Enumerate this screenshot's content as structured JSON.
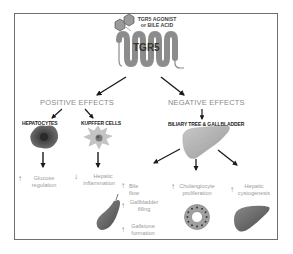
{
  "diagram": {
    "receptor": {
      "ligand_label_line1": "TGR5 AGONIST",
      "ligand_label_line2": "or BILE ACID",
      "receptor_label": "TGR5"
    },
    "positive": {
      "title": "POSITIVE EFFECTS",
      "targets": [
        {
          "label": "HEPATOCYTES",
          "effect_direction": "↑",
          "effect_line1": "Glucose",
          "effect_line2": "regulation"
        },
        {
          "label": "KUPFFER CELLS",
          "effect_direction": "↓",
          "effect_line1": "Hepatic",
          "effect_line2": "inflammation"
        }
      ]
    },
    "negative": {
      "title": "NEGATIVE EFFECTS",
      "target": "BILIARY TREE & GALLBLADDER",
      "effects": [
        {
          "direction": "↑",
          "line1": "Bile flow",
          "line2": ""
        },
        {
          "direction": "↑",
          "line1": "Gallbladder",
          "line2": "filling"
        },
        {
          "direction": "↑",
          "line1": "Gallstone",
          "line2": "formation"
        },
        {
          "direction": "↑",
          "line1": "Cholangiocyte",
          "line2": "proliferation"
        },
        {
          "direction": "↑",
          "line1": "Hepatic",
          "line2": "cystogenesis"
        }
      ]
    },
    "colors": {
      "frame": "#6f6f6f",
      "arrow": "#1a1a1a",
      "section_title": "#8a8a8a",
      "effect_text": "#9a9a9a",
      "receptor": "#8c8c8c",
      "hepatocyte": "#4a4a4a",
      "kupffer": "#b8b8b8"
    }
  }
}
